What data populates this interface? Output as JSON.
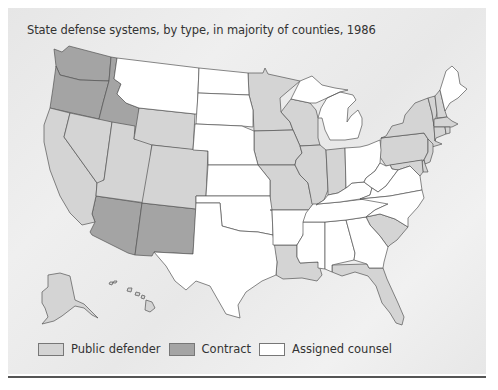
{
  "title": "State defense systems, by type, in majority of counties, 1986",
  "legend": [
    {
      "label": "Public defender",
      "color": "#d4d4d4"
    },
    {
      "label": "Contract",
      "color": "#a4a4a4"
    },
    {
      "label": "Assigned counsel",
      "color": "#ffffff"
    }
  ],
  "colors": {
    "public_defender": "#d4d4d4",
    "contract": "#a4a4a4",
    "assigned_counsel": "#ffffff"
  },
  "states": {
    "contract": [
      "Washington",
      "Oregon",
      "Idaho",
      "Arizona",
      "New Mexico"
    ],
    "public_defender": [
      "California",
      "Nevada",
      "Utah",
      "Wyoming",
      "Colorado",
      "Minnesota",
      "Wisconsin",
      "Iowa",
      "Missouri",
      "Illinois",
      "Indiana",
      "Louisiana",
      "Florida",
      "South Carolina",
      "Pennsylvania",
      "New York",
      "Vermont",
      "New Hampshire",
      "Massachusetts",
      "Connecticut",
      "Rhode Island",
      "New Jersey",
      "Delaware",
      "Maryland",
      "Alaska",
      "Hawaii"
    ],
    "assigned_counsel": [
      "Montana",
      "North Dakota",
      "South Dakota",
      "Nebraska",
      "Kansas",
      "Oklahoma",
      "Texas",
      "Arkansas",
      "Mississippi",
      "Alabama",
      "Georgia",
      "Tennessee",
      "Kentucky",
      "Ohio",
      "Michigan",
      "West Virginia",
      "Virginia",
      "North Carolina",
      "Maine"
    ]
  }
}
